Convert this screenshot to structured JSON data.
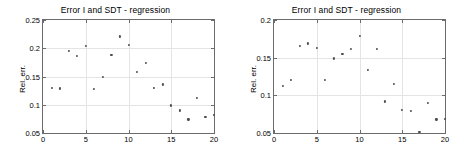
{
  "figure": {
    "background_color": "#ffffff",
    "axis_color": "#6b6b6b",
    "grid_color": "#e4e4e4",
    "marker_color": "#4d4d4d"
  },
  "chart_data": [
    {
      "type": "scatter",
      "title": "Error I and SDT - regression",
      "xlabel": "",
      "ylabel": "Rel. err.",
      "xlim": [
        0,
        20
      ],
      "ylim": [
        0.05,
        0.25
      ],
      "xticks": [
        0,
        5,
        10,
        15,
        20
      ],
      "xtick_labels": [
        "0",
        "5",
        "10",
        "15",
        "20"
      ],
      "yticks": [
        0.05,
        0.1,
        0.15,
        0.2,
        0.25
      ],
      "ytick_labels": [
        "0.05",
        "0.1",
        "0.15",
        "0.2",
        "0.25"
      ],
      "grid": true,
      "legend": null,
      "x": [
        1,
        2,
        3,
        4,
        5,
        6,
        7,
        8,
        9,
        10,
        11,
        12,
        13,
        14,
        15,
        16,
        17,
        18,
        19,
        20
      ],
      "values": [
        0.13,
        0.129,
        0.195,
        0.187,
        0.204,
        0.128,
        0.15,
        0.188,
        0.221,
        0.206,
        0.158,
        0.174,
        0.13,
        0.136,
        0.099,
        0.09,
        0.074,
        0.112,
        0.079,
        0.082
      ]
    },
    {
      "type": "scatter",
      "title": "Error I and SDT - regression",
      "xlabel": "",
      "ylabel": "Rel. err.",
      "xlim": [
        0,
        20
      ],
      "ylim": [
        0.05,
        0.2
      ],
      "xticks": [
        0,
        5,
        10,
        15,
        20
      ],
      "xtick_labels": [
        "0",
        "5",
        "10",
        "15",
        "20"
      ],
      "yticks": [
        0.05,
        0.1,
        0.15,
        0.2
      ],
      "ytick_labels": [
        "0.05",
        "0.1",
        "0.15",
        "0.2"
      ],
      "grid": true,
      "legend": null,
      "x": [
        1,
        2,
        3,
        4,
        5,
        6,
        7,
        8,
        9,
        10,
        11,
        12,
        13,
        14,
        15,
        16,
        17,
        18,
        19,
        20
      ],
      "values": [
        0.112,
        0.12,
        0.166,
        0.169,
        0.163,
        0.12,
        0.149,
        0.155,
        0.162,
        0.179,
        0.134,
        0.162,
        0.092,
        0.115,
        0.081,
        0.079,
        0.051,
        0.09,
        0.068,
        0.069
      ]
    }
  ]
}
